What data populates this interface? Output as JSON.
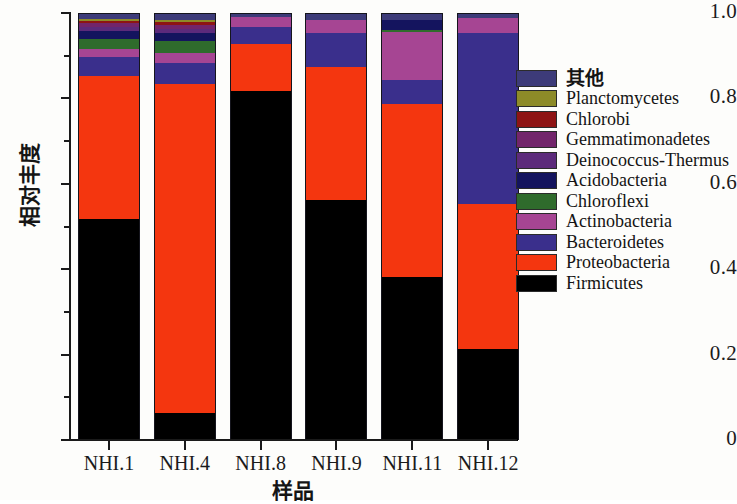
{
  "chart_data": {
    "type": "bar",
    "title": "",
    "xlabel": "样品",
    "ylabel": "相对丰度",
    "ylim": [
      0,
      1.0
    ],
    "stacked": true,
    "normalized": true,
    "grid": false,
    "legend_position": "right",
    "categories": [
      "NHI.1",
      "NHI.4",
      "NHI.8",
      "NHI.9",
      "NHI.11",
      "NHI.12"
    ],
    "ytick_labels": [
      "0",
      "0.2",
      "0.4",
      "0.6",
      "0.8",
      "1.0"
    ],
    "ytick_values": [
      0,
      0.2,
      0.4,
      0.6,
      0.8,
      1.0
    ],
    "yminor_values": [
      0.1,
      0.3,
      0.5,
      0.7,
      0.9
    ],
    "legend_order_top_to_bottom": [
      "其他",
      "Planctomycetes",
      "Chlorobi",
      "Gemmatimonadetes",
      "Deinococcus-Thermus",
      "Acidobacteria",
      "Chloroflexi",
      "Actinobacteria",
      "Bacteroidetes",
      "Proteobacteria",
      "Firmicutes"
    ],
    "colors": {
      "其他": "#3d3b79",
      "Planctomycetes": "#8d8b28",
      "Chlorobi": "#8e1414",
      "Gemmatimonadetes": "#72256b",
      "Deinococcus-Thermus": "#5c2a7b",
      "Acidobacteria": "#14145e",
      "Chloroflexi": "#2f6b2c",
      "Actinobacteria": "#a64593",
      "Bacteroidetes": "#3a2f8c",
      "Proteobacteria": "#f4360f",
      "Firmicutes": "#000000"
    },
    "series": [
      {
        "name": "Firmicutes",
        "values": [
          0.52,
          0.065,
          0.82,
          0.565,
          0.385,
          0.215
        ]
      },
      {
        "name": "Proteobacteria",
        "values": [
          0.335,
          0.77,
          0.11,
          0.31,
          0.405,
          0.34
        ]
      },
      {
        "name": "Bacteroidetes",
        "values": [
          0.045,
          0.05,
          0.04,
          0.08,
          0.055,
          0.4
        ]
      },
      {
        "name": "Actinobacteria",
        "values": [
          0.017,
          0.024,
          0.022,
          0.03,
          0.112,
          0.035
        ]
      },
      {
        "name": "Chloroflexi",
        "values": [
          0.025,
          0.027,
          0.0,
          0.0,
          0.006,
          0.0
        ]
      },
      {
        "name": "Acidobacteria",
        "values": [
          0.018,
          0.02,
          0.0,
          0.0,
          0.024,
          0.0
        ]
      },
      {
        "name": "Deinococcus-Thermus",
        "values": [
          0.01,
          0.008,
          0.0,
          0.0,
          0.0,
          0.0
        ]
      },
      {
        "name": "Gemmatimonadetes",
        "values": [
          0.008,
          0.01,
          0.0,
          0.0,
          0.0,
          0.0
        ]
      },
      {
        "name": "Chlorobi",
        "values": [
          0.006,
          0.007,
          0.0,
          0.0,
          0.0,
          0.0
        ]
      },
      {
        "name": "Planctomycetes",
        "values": [
          0.005,
          0.006,
          0.0,
          0.0,
          0.0,
          0.0
        ]
      },
      {
        "name": "其他",
        "values": [
          0.011,
          0.013,
          0.008,
          0.015,
          0.013,
          0.01
        ]
      }
    ]
  }
}
